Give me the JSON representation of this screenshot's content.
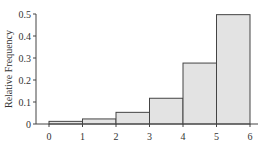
{
  "chart_data": {
    "type": "bar",
    "subtype": "histogram",
    "title": "",
    "xlabel": "",
    "ylabel": "Relative Frequency",
    "bin_edges": [
      0,
      1,
      2,
      3,
      4,
      5,
      6
    ],
    "categories": [
      "0-1",
      "1-2",
      "2-3",
      "3-4",
      "4-5",
      "5-6"
    ],
    "values": [
      0.012,
      0.023,
      0.053,
      0.117,
      0.277,
      0.497
    ],
    "xticks": [
      "0",
      "1",
      "2",
      "3",
      "4",
      "5",
      "6"
    ],
    "yticks": [
      "0",
      "0.1",
      "0.2",
      "0.3",
      "0.4",
      "0.5"
    ],
    "ylim": [
      0,
      0.5
    ],
    "xlim": [
      0,
      6
    ],
    "grid": false,
    "legend": null,
    "colors": {
      "bar_fill": "#e3e3e3",
      "bar_stroke": "#444444",
      "axis": "#444444",
      "text": "#333333"
    }
  }
}
